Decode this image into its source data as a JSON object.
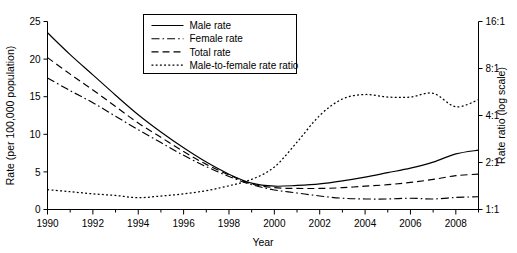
{
  "chart_data": {
    "type": "line",
    "title": "",
    "xlabel": "Year",
    "ylabel": "Rate (per 100,000 population)",
    "y2label": "Rate ratio (log scale)",
    "xlim": [
      1990,
      2009
    ],
    "ylim": [
      0,
      25
    ],
    "y2lim": [
      1,
      16
    ],
    "y2_scale": "log",
    "grid": false,
    "legend_position": "top-center",
    "x": [
      1990,
      1991,
      1992,
      1993,
      1994,
      1995,
      1996,
      1997,
      1998,
      1999,
      2000,
      2001,
      2002,
      2003,
      2004,
      2005,
      2006,
      2007,
      2008,
      2009
    ],
    "xticks": [
      "1990",
      "1992",
      "1994",
      "1996",
      "1998",
      "2000",
      "2002",
      "2004",
      "2006",
      "2008"
    ],
    "xtick_values": [
      1990,
      1992,
      1994,
      1996,
      1998,
      2000,
      2002,
      2004,
      2006,
      2008
    ],
    "yticks": [
      "0",
      "5",
      "10",
      "15",
      "20",
      "25"
    ],
    "ytick_values": [
      0,
      5,
      10,
      15,
      20,
      25
    ],
    "y2ticks": [
      "1:1",
      "2:1",
      "4:1",
      "8:1",
      "16:1"
    ],
    "y2tick_values": [
      1,
      2,
      4,
      8,
      16
    ],
    "series": [
      {
        "name": "Male rate",
        "style": "solid",
        "axis": "left",
        "values": [
          23.5,
          20.6,
          17.9,
          15.2,
          12.6,
          10.3,
          8.2,
          6.3,
          4.7,
          3.5,
          3.1,
          3.2,
          3.4,
          3.8,
          4.3,
          4.9,
          5.5,
          6.3,
          7.4,
          7.9
        ]
      },
      {
        "name": "Female rate",
        "style": "dashdot",
        "axis": "left",
        "values": [
          17.5,
          15.8,
          14.2,
          12.4,
          10.6,
          8.9,
          7.2,
          5.7,
          4.4,
          3.3,
          2.6,
          2.2,
          1.8,
          1.5,
          1.4,
          1.4,
          1.5,
          1.4,
          1.6,
          1.7
        ]
      },
      {
        "name": "Total rate",
        "style": "dashed",
        "axis": "left",
        "values": [
          20.2,
          18.0,
          15.9,
          13.7,
          11.5,
          9.6,
          7.7,
          6.0,
          4.6,
          3.4,
          2.9,
          2.8,
          2.8,
          2.9,
          3.1,
          3.3,
          3.6,
          4.0,
          4.5,
          4.7
        ]
      },
      {
        "name": "Male-to-female rate ratio",
        "style": "dotted",
        "axis": "right",
        "values": [
          1.34,
          1.3,
          1.26,
          1.23,
          1.19,
          1.22,
          1.26,
          1.32,
          1.42,
          1.56,
          1.87,
          2.7,
          4.0,
          5.1,
          5.45,
          5.25,
          5.25,
          5.55,
          4.55,
          5.05
        ]
      }
    ]
  },
  "legend": {
    "entries": [
      {
        "label": "Male rate"
      },
      {
        "label": "Female rate"
      },
      {
        "label": "Total rate"
      },
      {
        "label": "Male-to-female rate ratio"
      }
    ]
  },
  "axes": {
    "left_title": "Rate (per 100,000 population)",
    "right_title": "Rate ratio (log scale)",
    "bottom_title": "Year"
  },
  "colors": {
    "line": "#000000",
    "axis": "#000000",
    "background": "#ffffff"
  }
}
